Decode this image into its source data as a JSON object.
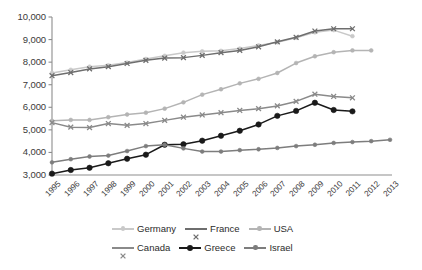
{
  "chart_data": {
    "type": "line",
    "title": "",
    "subtitle": "",
    "xlabel": "",
    "ylabel": "",
    "grid": false,
    "legend_position": "bottom",
    "x": [
      1995,
      1996,
      1997,
      1998,
      1999,
      2000,
      2001,
      2002,
      2003,
      2004,
      2005,
      2006,
      2007,
      2008,
      2009,
      2010,
      2011,
      2012,
      2013
    ],
    "xtick_labels": [
      "1995",
      "1996",
      "1997",
      "1998",
      "1999",
      "2000",
      "2001",
      "2002",
      "2003",
      "2004",
      "2005",
      "2006",
      "2007",
      "2008",
      "2009",
      "2010",
      "2011",
      "2012",
      "2013"
    ],
    "ytick_labels": [
      "10,000",
      "9,000",
      "8,000",
      "7,000",
      "6,000",
      "5,000",
      "4,000",
      "3,000"
    ],
    "ytick_values": [
      10000,
      9000,
      8000,
      7000,
      6000,
      5000,
      4000,
      3000
    ],
    "ylim": [
      3000,
      10000
    ],
    "xlim": [
      1995,
      2013
    ],
    "series": [
      {
        "name": "Germany",
        "color": "#c9c9c9",
        "marker": "circle",
        "values": [
          7520,
          7660,
          7800,
          7860,
          7980,
          8140,
          8280,
          8420,
          8480,
          8500,
          8600,
          8740,
          8880,
          9080,
          9320,
          9420,
          9150,
          null,
          null
        ]
      },
      {
        "name": "France",
        "color": "#6e6e6e",
        "marker": "x",
        "values": [
          7400,
          7540,
          7700,
          7800,
          7940,
          8080,
          8180,
          8200,
          8300,
          8420,
          8520,
          8680,
          8900,
          9100,
          9380,
          9480,
          9480,
          null,
          null
        ]
      },
      {
        "name": "USA",
        "color": "#b4b4b4",
        "marker": "circle",
        "values": [
          5400,
          5440,
          5440,
          5560,
          5680,
          5760,
          5940,
          6220,
          6560,
          6800,
          7060,
          7260,
          7520,
          7960,
          8260,
          8440,
          8520,
          8520,
          null
        ]
      },
      {
        "name": "Canada",
        "color": "#8a8a8a",
        "marker": "x",
        "values": [
          5320,
          5120,
          5100,
          5280,
          5200,
          5280,
          5420,
          5560,
          5660,
          5760,
          5860,
          5940,
          6060,
          6260,
          6580,
          6480,
          6420,
          null,
          null
        ]
      },
      {
        "name": "Greece",
        "color": "#1a1a1a",
        "marker": "circle",
        "values": [
          3060,
          3220,
          3320,
          3520,
          3720,
          3900,
          4340,
          4360,
          4520,
          4740,
          4960,
          5240,
          5620,
          5840,
          6200,
          5880,
          5820,
          null,
          null
        ]
      },
      {
        "name": "Israel",
        "color": "#7d7d7d",
        "marker": "circle",
        "values": [
          3560,
          3700,
          3820,
          3860,
          4060,
          4280,
          4340,
          4180,
          4040,
          4040,
          4100,
          4140,
          4200,
          4280,
          4340,
          4420,
          4460,
          4500,
          4560
        ]
      }
    ]
  },
  "legend": {
    "rows": [
      [
        {
          "label": "Germany",
          "color": "#c9c9c9",
          "marker": "circle"
        },
        {
          "label": "France",
          "color": "#6e6e6e",
          "marker": "x"
        },
        {
          "label": "USA",
          "color": "#b4b4b4",
          "marker": "circle"
        }
      ],
      [
        {
          "label": "Canada",
          "color": "#8a8a8a",
          "marker": "x"
        },
        {
          "label": "Greece",
          "color": "#1a1a1a",
          "marker": "circle"
        },
        {
          "label": "Israel",
          "color": "#7d7d7d",
          "marker": "circle"
        }
      ]
    ]
  },
  "axes": {
    "axis_color": "#8d8d8d",
    "tick_text_color": "#3a3a3a"
  }
}
